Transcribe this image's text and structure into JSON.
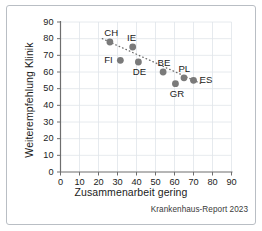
{
  "figure": {
    "source_note": "Krankenhaus-Report 2023"
  },
  "chart_data": {
    "type": "scatter",
    "title": "",
    "xlabel": "Zusammenarbeit gering",
    "ylabel": "Weiterempfehlung Klinik",
    "xlim": [
      0,
      90
    ],
    "ylim": [
      0,
      90
    ],
    "xticks": [
      0,
      10,
      20,
      30,
      40,
      50,
      60,
      70,
      80,
      90
    ],
    "yticks": [
      0,
      10,
      20,
      30,
      40,
      50,
      60,
      70,
      80,
      90
    ],
    "grid": true,
    "legend": "none",
    "point_color": "#7a7a7a",
    "grid_color": "#dfe4ea",
    "axis_color": "#6e6e6e",
    "trendline": {
      "style": "dotted",
      "color": "#6e6e6e",
      "x_start": 22,
      "y_start": 80,
      "x_end": 74,
      "y_end": 53
    },
    "points": [
      {
        "label": "CH",
        "x": 26.0,
        "y": 78.0,
        "label_pos": "above"
      },
      {
        "label": "IE",
        "x": 38.0,
        "y": 75.0,
        "label_pos": "above"
      },
      {
        "label": "FI",
        "x": 31.5,
        "y": 67.0,
        "label_pos": "left"
      },
      {
        "label": "DE",
        "x": 41.0,
        "y": 66.0,
        "label_pos": "below"
      },
      {
        "label": "BE",
        "x": 54.0,
        "y": 60.0,
        "label_pos": "above"
      },
      {
        "label": "PL",
        "x": 65.0,
        "y": 56.5,
        "label_pos": "above"
      },
      {
        "label": "ES",
        "x": 70.0,
        "y": 55.0,
        "label_pos": "right"
      },
      {
        "label": "GR",
        "x": 60.5,
        "y": 53.0,
        "label_pos": "below"
      }
    ]
  }
}
